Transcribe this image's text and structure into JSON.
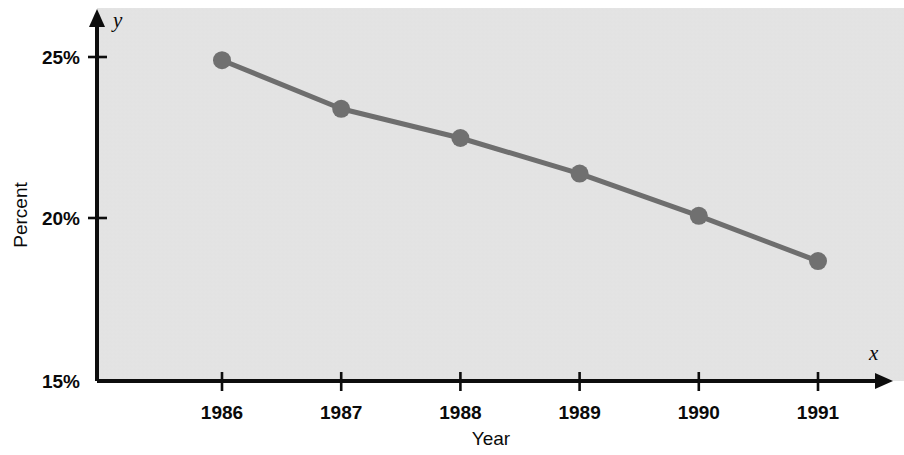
{
  "chart_data": {
    "type": "line",
    "title": "",
    "subtitle": "",
    "xlabel": "Year",
    "ylabel": "Percent",
    "x_axis_variable": "x",
    "y_axis_variable": "y",
    "categories": [
      "1986",
      "1987",
      "1988",
      "1989",
      "1990",
      "1991"
    ],
    "x": [
      1986,
      1987,
      1988,
      1989,
      1990,
      1991
    ],
    "values": [
      24.9,
      23.4,
      22.5,
      21.4,
      20.1,
      18.7
    ],
    "value_labels": [
      "24.9%",
      "23.4%",
      "22.5%",
      "21.4%",
      "20.1%",
      "18.7%"
    ],
    "ylim": [
      15,
      26
    ],
    "xlim": [
      1985.3,
      1992.0
    ],
    "y_ticks": [
      25,
      20,
      15
    ],
    "y_tick_labels": [
      "25%",
      "20%",
      "15%"
    ],
    "x_ticks": [
      1986,
      1987,
      1988,
      1989,
      1990,
      1991
    ],
    "x_tick_labels": [
      "1986",
      "1987",
      "1988",
      "1989",
      "1990",
      "1991"
    ],
    "grid": false,
    "legend": null,
    "legend_position": "none",
    "annotations": [],
    "series": [
      {
        "name": "Percent",
        "values": [
          24.9,
          23.4,
          22.5,
          21.4,
          20.1,
          18.7
        ]
      }
    ]
  },
  "axes": {
    "y_tick_labels": [
      "25%",
      "20%",
      "15%"
    ],
    "x_tick_labels": [
      "1986",
      "1987",
      "1988",
      "1989",
      "1990",
      "1991"
    ],
    "y_axis_title": "Percent",
    "x_axis_title": "Year",
    "x_variable_glyph": "x",
    "y_variable_glyph": "y"
  },
  "colors": {
    "plot_background": "#e3e3e3",
    "page_background": "#ffffff",
    "axis": "#0d0d0d",
    "series": "#6e6e6e",
    "marker": "#707070",
    "text": "#0a0a0a"
  }
}
